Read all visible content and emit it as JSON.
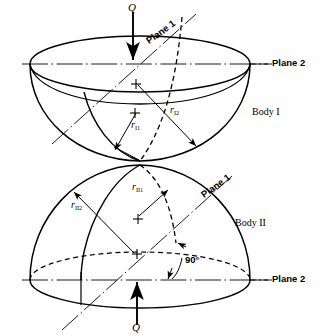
{
  "figure": {
    "background_color": "#ffffff",
    "line_color": "#000000",
    "width": 320,
    "height": 336
  },
  "labels": {
    "load_top": "Q",
    "load_bottom": "Q",
    "plane1_top": "Plane 1",
    "plane1_bottom": "Plane 1",
    "plane2_top": "Plane 2",
    "plane2_bottom": "Plane 2",
    "body1": "Body I",
    "body2": "Body II",
    "angle": "90°",
    "r_I1_base": "r",
    "r_I1_sub": "I1",
    "r_I2_base": "r",
    "r_I2_sub": "I2",
    "r_II1_base": "r",
    "r_II1_sub": "II1",
    "r_II2_base": "r",
    "r_II2_sub": "II2"
  },
  "geometry": {
    "body1": {
      "name": "Body I",
      "shape": "lower-half hemisphere (bowl)",
      "center_x": 140,
      "rim_y": 64,
      "rim_rx": 110,
      "rim_ry": 28,
      "bottom_y": 160,
      "radius_markers": [
        "r I1",
        "r I2"
      ]
    },
    "body2": {
      "name": "Body II",
      "shape": "upper-half hemisphere (dome)",
      "center_x": 140,
      "rim_y": 280,
      "rim_rx": 110,
      "rim_ry": 28,
      "top_y": 166,
      "radius_markers": [
        "r II1",
        "r II2"
      ]
    },
    "contact_point": {
      "x": 140,
      "y": 163
    },
    "plane2_line_top_y": 64,
    "plane2_line_bottom_y": 280,
    "plane1_axis_angle_deg": -35,
    "angle_between_planes": "90°"
  }
}
